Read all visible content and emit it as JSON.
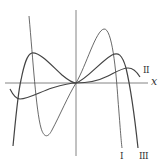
{
  "diagram": {
    "type": "function-curves",
    "axes": {
      "x_label": "x",
      "origin": [
        76,
        83
      ]
    },
    "curves": [
      {
        "id": "I",
        "label": "I",
        "stroke_width": 0.8
      },
      {
        "id": "II",
        "label": "II",
        "stroke_width": 1.2
      },
      {
        "id": "III",
        "label": "III",
        "stroke_width": 1.2
      }
    ],
    "colors": {
      "stroke": "#444444",
      "axis": "#666666",
      "background": "#ffffff"
    }
  }
}
